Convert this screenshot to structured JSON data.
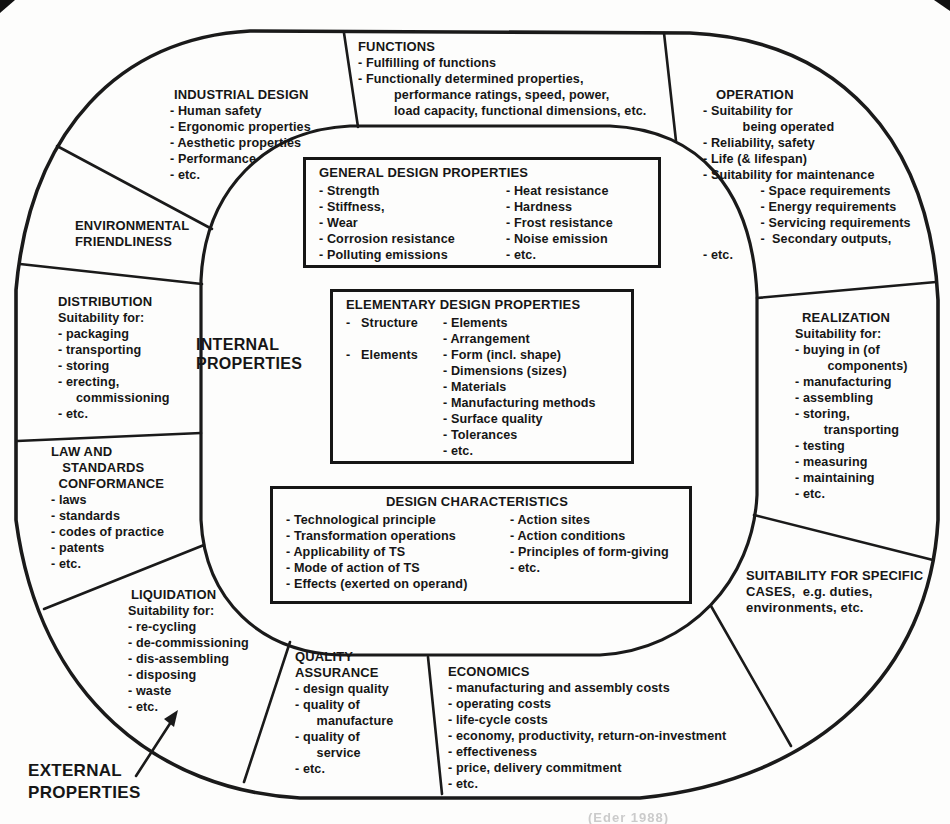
{
  "labels": {
    "internal": "INTERNAL\nPROPERTIES",
    "external": "EXTERNAL\nPROPERTIES",
    "caption_fragment": "(Eder 1988)"
  },
  "segments": {
    "industrial_design": {
      "title": "INDUSTRIAL DESIGN",
      "body": "- Human safety\n- Ergonomic properties\n- Aesthetic properties\n- Performance\n- etc."
    },
    "functions": {
      "title": "FUNCTIONS",
      "body": "- Fulfilling of functions\n- Functionally determined properties,\n          performance ratings, speed, power,\n          load capacity, functional dimensions, etc."
    },
    "operation": {
      "title": "OPERATION",
      "body": "- Suitability for\n           being operated\n- Reliability, safety\n- Life (& lifespan)\n- Suitability for maintenance\n                - Space requirements\n                - Energy requirements\n                - Servicing requirements\n                -  Secondary outputs,\n- etc."
    },
    "environmental": {
      "title": "ENVIRONMENTAL\nFRIENDLINESS",
      "body": ""
    },
    "distribution": {
      "title": "DISTRIBUTION",
      "body": "Suitability for:\n- packaging\n- transporting\n- storing\n- erecting,\n     commissioning\n- etc."
    },
    "law": {
      "title": "LAW AND\n   STANDARDS\n  CONFORMANCE",
      "body": "- laws\n- standards\n- codes of practice\n- patents\n- etc."
    },
    "liquidation": {
      "title": "LIQUIDATION",
      "body": "Suitability for:\n- re-cycling\n- de-commissioning\n- dis-assembling\n- disposing\n- waste\n- etc."
    },
    "quality_assurance": {
      "title": "QUALITY\nASSURANCE",
      "body": "- design quality\n- quality of\n      manufacture\n- quality of\n      service\n- etc."
    },
    "economics": {
      "title": "ECONOMICS",
      "body": "- manufacturing and assembly costs\n- operating costs\n- life-cycle costs\n- economy, productivity, return-on-investment\n- effectiveness\n- price, delivery commitment\n- etc."
    },
    "specific_cases": {
      "title": "SUITABILITY FOR SPECIFIC\nCASES,  e.g. duties,\nenvironments, etc.",
      "body": ""
    },
    "realization": {
      "title": "REALIZATION",
      "body": "Suitability for:\n- buying in (of\n         components)\n- manufacturing\n- assembling\n- storing,\n        transporting\n- testing\n- measuring\n- maintaining\n- etc."
    }
  },
  "boxes": {
    "general": {
      "title": "GENERAL DESIGN PROPERTIES",
      "col1": "- Strength\n- Stiffness,\n- Wear\n- Corrosion resistance\n- Polluting emissions",
      "col2": "- Heat resistance\n- Hardness\n- Frost resistance\n- Noise emission\n- etc."
    },
    "elementary": {
      "title": "ELEMENTARY DESIGN PROPERTIES",
      "col1": "-   Structure\n\n-   Elements",
      "col2": "- Elements\n- Arrangement\n- Form (incl. shape)\n- Dimensions (sizes)\n- Materials\n- Manufacturing methods\n- Surface quality\n- Tolerances\n- etc."
    },
    "characteristics": {
      "title": "DESIGN CHARACTERISTICS",
      "col1": "- Technological principle\n- Transformation operations\n- Applicability of TS\n- Mode of action of TS\n- Effects (exerted on operand)",
      "col2": "- Action sites\n- Action conditions\n- Principles of form-giving\n- etc."
    }
  }
}
